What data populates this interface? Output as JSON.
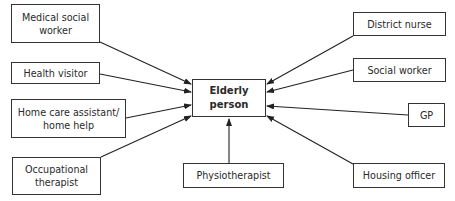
{
  "diagram": {
    "center": {
      "label_line1": "Elderly",
      "label_line2": "person"
    },
    "nodes": {
      "medical_social_worker": {
        "line1": "Medical social",
        "line2": "worker"
      },
      "health_visitor": {
        "label": "Health visitor"
      },
      "home_care": {
        "line1": "Home care assistant/",
        "line2": "home help"
      },
      "occupational_therapist": {
        "line1": "Occupational",
        "line2": "therapist"
      },
      "physiotherapist": {
        "label": "Physiotherapist"
      },
      "district_nurse": {
        "label": "District nurse"
      },
      "social_worker": {
        "label": "Social worker"
      },
      "gp": {
        "label": "GP"
      },
      "housing_officer": {
        "label": "Housing officer"
      }
    },
    "edges": [
      {
        "from": "Medical social worker",
        "to": "Elderly person"
      },
      {
        "from": "Health visitor",
        "to": "Elderly person"
      },
      {
        "from": "Home care assistant/home help",
        "to": "Elderly person"
      },
      {
        "from": "Occupational therapist",
        "to": "Elderly person"
      },
      {
        "from": "Physiotherapist",
        "to": "Elderly person"
      },
      {
        "from": "District nurse",
        "to": "Elderly person"
      },
      {
        "from": "Social worker",
        "to": "Elderly person"
      },
      {
        "from": "GP",
        "to": "Elderly person"
      },
      {
        "from": "Housing officer",
        "to": "Elderly person"
      }
    ]
  }
}
